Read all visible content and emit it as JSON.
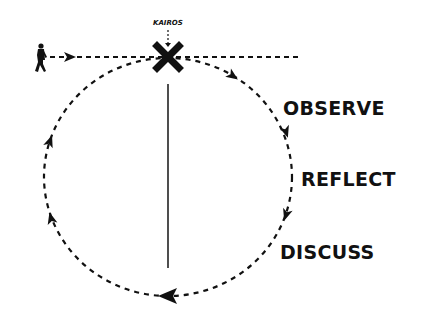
{
  "diagram": {
    "type": "cycle",
    "marker": {
      "label": "KAIROS",
      "icon": "x-mark-icon"
    },
    "entry": {
      "icon": "walking-person-icon",
      "description": "person walks along a dashed horizontal line into the cycle"
    },
    "stages": [
      {
        "label": "OBSERVE"
      },
      {
        "label": "REFLECT"
      },
      {
        "label": "DISCUSS"
      }
    ],
    "direction": "clockwise",
    "colors": {
      "ink": "#111111",
      "background": "#ffffff"
    }
  }
}
